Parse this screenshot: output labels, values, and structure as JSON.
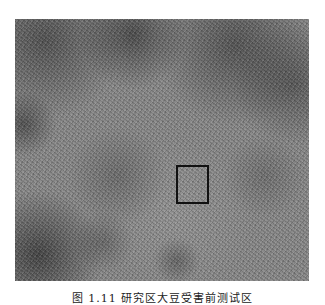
{
  "figure": {
    "colors": {
      "base_gray": "#8a8a8a",
      "dark_patch": "#333333",
      "roi_border": "#111111"
    },
    "roi_box": {
      "label": "",
      "position_hint": "center-right, lower half"
    }
  },
  "caption": {
    "text": "图 1.11   研究区大豆受害前测试区",
    "clipped": true
  }
}
